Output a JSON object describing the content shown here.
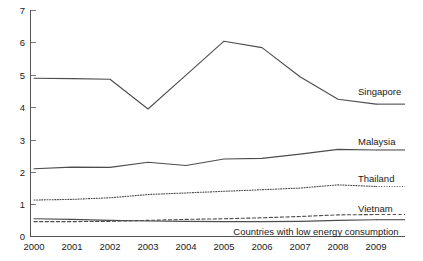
{
  "chart_data": {
    "type": "line",
    "title": "",
    "xlabel": "",
    "ylabel": "",
    "x": [
      2000,
      2001,
      2002,
      2003,
      2004,
      2005,
      2006,
      2007,
      2008,
      2009
    ],
    "categories": [
      "2000",
      "2001",
      "2002",
      "2003",
      "2004",
      "2005",
      "2006",
      "2007",
      "2008",
      "2009"
    ],
    "xlim": [
      2000,
      2009
    ],
    "ylim": [
      0,
      7
    ],
    "y_ticks": [
      "0",
      "1",
      "2",
      "3",
      "4",
      "5",
      "6",
      "7"
    ],
    "y_tick_values": [
      0,
      1,
      2,
      3,
      4,
      5,
      6,
      7
    ],
    "grid": false,
    "legend_position": "right-inline-labels",
    "series": [
      {
        "name": "Singapore",
        "style": "solid",
        "color": "#4d4d4d",
        "label": "Singapore",
        "values": [
          4.9,
          4.89,
          4.87,
          3.95,
          5.0,
          6.05,
          5.85,
          4.95,
          4.25,
          4.1
        ]
      },
      {
        "name": "Malaysia",
        "style": "solid",
        "color": "#4d4d4d",
        "label": "Malaysia",
        "values": [
          2.1,
          2.15,
          2.14,
          2.3,
          2.2,
          2.4,
          2.42,
          2.55,
          2.7,
          2.68
        ]
      },
      {
        "name": "Thailand",
        "style": "dotted",
        "color": "#4d4d4d",
        "label": "Thailand",
        "values": [
          1.13,
          1.15,
          1.2,
          1.3,
          1.35,
          1.4,
          1.45,
          1.5,
          1.6,
          1.55
        ]
      },
      {
        "name": "Vietnam",
        "style": "dashed",
        "color": "#4d4d4d",
        "label": "Vietnam",
        "values": [
          0.46,
          0.46,
          0.47,
          0.5,
          0.53,
          0.55,
          0.58,
          0.62,
          0.67,
          0.68
        ]
      },
      {
        "name": "Countries with low energy consumption",
        "style": "solid",
        "color": "#4d4d4d",
        "label": "Countries with low energy consumption",
        "values": [
          0.55,
          0.53,
          0.5,
          0.48,
          0.47,
          0.46,
          0.46,
          0.47,
          0.5,
          0.52
        ]
      }
    ]
  }
}
